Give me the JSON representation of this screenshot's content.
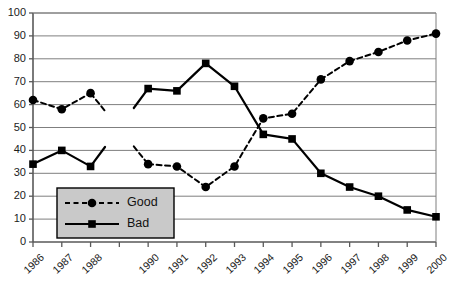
{
  "chart_data": {
    "type": "line",
    "title": "",
    "subtitle": "",
    "xlabel": "",
    "ylabel": "",
    "ylim": [
      0,
      100
    ],
    "ytick_step": 10,
    "yticks": [
      0,
      10,
      20,
      30,
      40,
      50,
      60,
      70,
      80,
      90,
      100
    ],
    "categories": [
      "1986",
      "1987",
      "1988",
      "",
      "1990",
      "1991",
      "1992",
      "1993",
      "1994",
      "1995",
      "1996",
      "1997",
      "1998",
      "1999",
      "2000"
    ],
    "tick_labels": [
      "1986",
      "1987",
      "1988",
      "1990",
      "1991",
      "1992",
      "1993",
      "1994",
      "1995",
      "1996",
      "1997",
      "1998",
      "1999",
      "2000"
    ],
    "grid": "horizontal",
    "legend_position": "bottom-left",
    "missing_category_index": 3,
    "series": [
      {
        "name": "Good",
        "style": "dashed",
        "marker": "circle",
        "color": "#000000",
        "values": [
          62,
          58,
          65,
          null,
          34,
          33,
          24,
          33,
          54,
          56,
          71,
          79,
          83,
          88,
          91
        ]
      },
      {
        "name": "Bad",
        "style": "solid",
        "marker": "square",
        "color": "#000000",
        "values": [
          34,
          40,
          33,
          null,
          67,
          66,
          78,
          68,
          47,
          45,
          30,
          24,
          20,
          14,
          11
        ]
      }
    ]
  },
  "legend": {
    "items": [
      {
        "label": "Good",
        "style": "dashed",
        "marker": "circle"
      },
      {
        "label": "Bad",
        "style": "solid",
        "marker": "square"
      }
    ],
    "background": "#c9c9c9",
    "border": "#000000"
  },
  "axes": {
    "gridline_color": "#7f7f7f",
    "axis_color": "#595959",
    "tick_color": "#595959"
  }
}
